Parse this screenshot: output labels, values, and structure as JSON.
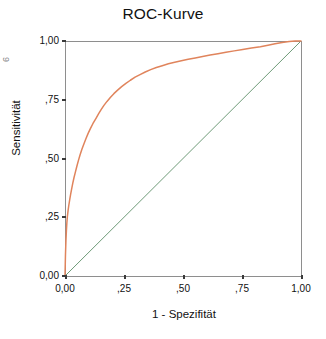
{
  "chart_data": {
    "type": "line",
    "title": "ROC-Kurve",
    "xlabel": "1 - Spezifität",
    "ylabel": "Sensitivität",
    "xlim": [
      0,
      1
    ],
    "ylim": [
      0,
      1
    ],
    "grid": false,
    "legend": "none",
    "xticks": [
      "0,00",
      ",25",
      ",50",
      ",75",
      "1,00"
    ],
    "xtick_values": [
      0.0,
      0.25,
      0.5,
      0.75,
      1.0
    ],
    "yticks": [
      "0,00",
      ",25",
      ",50",
      ",75",
      "1,00"
    ],
    "ytick_values": [
      0.0,
      0.25,
      0.5,
      0.75,
      1.0
    ],
    "series": [
      {
        "name": "ROC-Kurve",
        "color": "#E0845C",
        "x": [
          0.0,
          0.002,
          0.004,
          0.006,
          0.008,
          0.01,
          0.013,
          0.016,
          0.02,
          0.024,
          0.028,
          0.033,
          0.038,
          0.044,
          0.05,
          0.057,
          0.064,
          0.072,
          0.08,
          0.089,
          0.098,
          0.108,
          0.118,
          0.125,
          0.132,
          0.142,
          0.153,
          0.165,
          0.178,
          0.192,
          0.207,
          0.223,
          0.24,
          0.258,
          0.277,
          0.297,
          0.318,
          0.34,
          0.363,
          0.387,
          0.412,
          0.438,
          0.465,
          0.493,
          0.522,
          0.552,
          0.583,
          0.615,
          0.648,
          0.682,
          0.717,
          0.753,
          0.79,
          0.828,
          0.86,
          0.89,
          0.92,
          0.95,
          0.975,
          1.0
        ],
        "y": [
          0.0,
          0.09,
          0.15,
          0.195,
          0.228,
          0.252,
          0.278,
          0.3,
          0.325,
          0.348,
          0.37,
          0.395,
          0.418,
          0.442,
          0.466,
          0.492,
          0.516,
          0.54,
          0.562,
          0.585,
          0.607,
          0.628,
          0.648,
          0.66,
          0.672,
          0.69,
          0.708,
          0.726,
          0.743,
          0.76,
          0.776,
          0.791,
          0.806,
          0.82,
          0.833,
          0.846,
          0.857,
          0.868,
          0.878,
          0.887,
          0.895,
          0.903,
          0.91,
          0.916,
          0.922,
          0.928,
          0.934,
          0.94,
          0.946,
          0.952,
          0.958,
          0.964,
          0.97,
          0.976,
          0.982,
          0.988,
          0.994,
          0.998,
          1.0,
          1.0
        ]
      },
      {
        "name": "Referenzlinie",
        "color": "#6E9B78",
        "x": [
          0.0,
          1.0
        ],
        "y": [
          0.0,
          1.0
        ]
      }
    ]
  },
  "chart": {
    "title": "ROC-Kurve",
    "y_axis_title": "Sensitivität",
    "x_axis_title": "1 - Spezifität",
    "edge_artifact": "6",
    "y_tick_labels": [
      "1,00",
      ",75",
      ",50",
      ",25",
      "0,00"
    ],
    "x_tick_labels": [
      "0,00",
      ",25",
      ",50",
      ",75",
      "1,00"
    ],
    "colors": {
      "curve": "#E0845C",
      "reference": "#6E9B78",
      "axis": "#8E8E8E",
      "text": "#111111",
      "background": "#FFFFFF"
    }
  }
}
